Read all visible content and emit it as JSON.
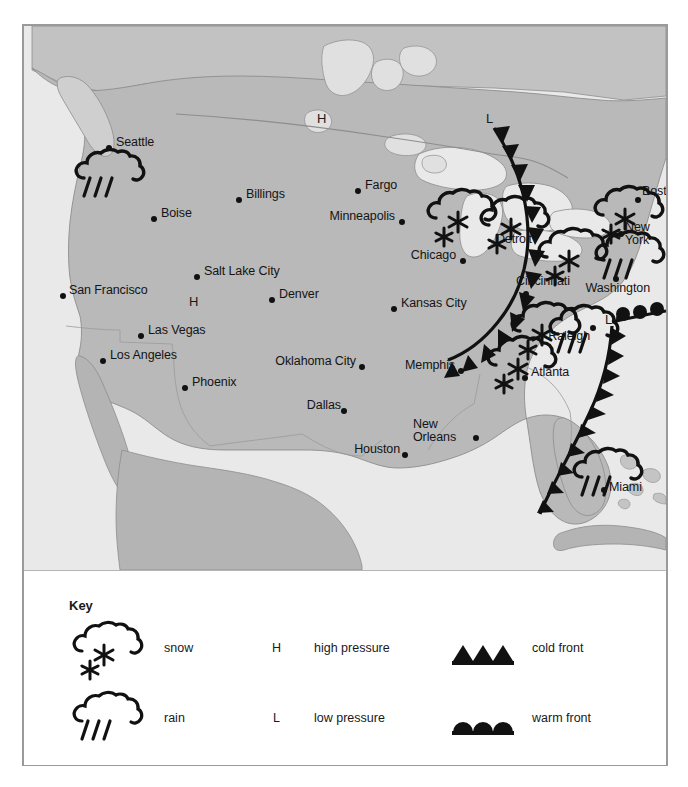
{
  "document": {
    "type": "weather-map",
    "region": "United States",
    "colors": {
      "land": "#b9b9b9",
      "water": "#e6e6e6",
      "canada_land": "#c6c6c6",
      "ink": "#111111",
      "frame": "#9a9a9a",
      "page": "#ffffff"
    }
  },
  "map": {
    "cities": [
      {
        "name": "Seattle",
        "label_x": 92,
        "label_y": 116,
        "dot_x": 85,
        "dot_y": 122,
        "align": "left"
      },
      {
        "name": "Billings",
        "label_x": 222,
        "label_y": 168,
        "dot_x": 215,
        "dot_y": 174,
        "align": "left"
      },
      {
        "name": "Boise",
        "label_x": 137,
        "label_y": 187,
        "dot_x": 130,
        "dot_y": 193,
        "align": "left"
      },
      {
        "name": "Fargo",
        "label_x": 341,
        "label_y": 159,
        "dot_x": 334,
        "dot_y": 165,
        "align": "left"
      },
      {
        "name": "Minneapolis",
        "label_x": 371,
        "label_y": 190,
        "dot_x": 378,
        "dot_y": 196,
        "align": "right"
      },
      {
        "name": "Chicago",
        "label_x": 432,
        "label_y": 229,
        "dot_x": 439,
        "dot_y": 235,
        "align": "right"
      },
      {
        "name": "Detroit",
        "label_x": 473,
        "label_y": 213,
        "dot_x": 512,
        "dot_y": 209,
        "align": "left"
      },
      {
        "name": "Salt Lake City",
        "label_x": 180,
        "label_y": 245,
        "dot_x": 173,
        "dot_y": 251,
        "align": "left"
      },
      {
        "name": "Denver",
        "label_x": 255,
        "label_y": 268,
        "dot_x": 248,
        "dot_y": 274,
        "align": "left"
      },
      {
        "name": "San Francisco",
        "label_x": 46,
        "label_y": 264,
        "dot_x": 39,
        "dot_y": 270,
        "align": "left"
      },
      {
        "name": "Kansas City",
        "label_x": 377,
        "label_y": 277,
        "dot_x": 370,
        "dot_y": 283,
        "align": "left"
      },
      {
        "name": "Cincinnati",
        "label_x": 495,
        "label_y": 255,
        "dot_x": 502,
        "dot_y": 268,
        "align": "left"
      },
      {
        "name": "Las Vegas",
        "label_x": 124,
        "label_y": 304,
        "dot_x": 117,
        "dot_y": 310,
        "align": "left"
      },
      {
        "name": "Los Angeles",
        "label_x": 86,
        "label_y": 329,
        "dot_x": 79,
        "dot_y": 335,
        "align": "left"
      },
      {
        "name": "Oklahoma City",
        "label_x": 246,
        "label_y": 335,
        "dot_x": 338,
        "dot_y": 341,
        "align": "left"
      },
      {
        "name": "Memphis",
        "label_x": 371,
        "label_y": 339,
        "dot_x": 437,
        "dot_y": 345,
        "align": "left"
      },
      {
        "name": "Atlanta",
        "label_x": 508,
        "label_y": 346,
        "dot_x": 501,
        "dot_y": 352,
        "align": "left"
      },
      {
        "name": "Raleigh",
        "label_x": 529,
        "label_y": 310,
        "dot_x": 569,
        "dot_y": 302,
        "align": "left"
      },
      {
        "name": "Washington",
        "label_x": 570,
        "label_y": 262,
        "dot_x": 592,
        "dot_y": 253,
        "align": "left"
      },
      {
        "name": "New\nYork",
        "label_x": 604,
        "label_y": 202,
        "dot_x": 597,
        "dot_y": 208,
        "align": "left"
      },
      {
        "name": "Boston",
        "label_x": 621,
        "label_y": 165,
        "dot_x": 614,
        "dot_y": 174,
        "align": "left"
      },
      {
        "name": "Phoenix",
        "label_x": 168,
        "label_y": 356,
        "dot_x": 161,
        "dot_y": 362,
        "align": "left"
      },
      {
        "name": "Dallas",
        "label_x": 281,
        "label_y": 379,
        "dot_x": 320,
        "dot_y": 385,
        "align": "left"
      },
      {
        "name": "New\nOrleans",
        "label_x": 394,
        "label_y": 399,
        "dot_x": 452,
        "dot_y": 412,
        "align": "left"
      },
      {
        "name": "Houston",
        "label_x": 321,
        "label_y": 423,
        "dot_x": 381,
        "dot_y": 429,
        "align": "left"
      },
      {
        "name": "Miami",
        "label_x": 587,
        "label_y": 458,
        "dot_x": 580,
        "dot_y": 464,
        "align": "left"
      }
    ],
    "pressure_systems": [
      {
        "type": "high",
        "symbol": "H",
        "x": 295,
        "y": 86
      },
      {
        "type": "high",
        "symbol": "H",
        "x": 167,
        "y": 270
      },
      {
        "type": "low",
        "symbol": "L",
        "x": 464,
        "y": 92
      },
      {
        "type": "low",
        "symbol": "L",
        "x": 583,
        "y": 293
      }
    ],
    "weather_symbols": [
      {
        "type": "snow",
        "x": 404,
        "y": 166,
        "city_ref": "Minneapolis-east"
      },
      {
        "type": "snow",
        "x": 457,
        "y": 173,
        "city_ref": "Detroit"
      },
      {
        "type": "snow",
        "x": 515,
        "y": 205,
        "city_ref": "Cincinnati-north"
      },
      {
        "type": "snow",
        "x": 571,
        "y": 163,
        "city_ref": "New York"
      },
      {
        "type": "rain",
        "x": 572,
        "y": 206,
        "city_ref": "Washington"
      },
      {
        "type": "snow",
        "x": 488,
        "y": 277,
        "city_ref": "Atlanta-north"
      },
      {
        "type": "snow",
        "x": 464,
        "y": 311,
        "city_ref": "Atlanta"
      },
      {
        "type": "rain",
        "x": 529,
        "y": 280,
        "city_ref": "Raleigh"
      },
      {
        "type": "rain",
        "x": 55,
        "y": 124,
        "city_ref": "Seattle"
      },
      {
        "type": "rain",
        "x": 552,
        "y": 424,
        "city_ref": "Miami"
      }
    ],
    "fronts": [
      {
        "type": "cold",
        "name": "main-cold-front",
        "description": "curving cold front from low near Great Lakes southwest to Memphis"
      },
      {
        "type": "warm",
        "name": "atlantic-warm-front",
        "description": "warm front extending east from low near Raleigh"
      },
      {
        "type": "cold",
        "name": "florida-cold-front",
        "description": "cold front trailing south along Florida coast"
      }
    ]
  },
  "key": {
    "title": "Key",
    "items": [
      {
        "symbol": "snow-cloud-icon",
        "label": "snow"
      },
      {
        "symbol": "rain-cloud-icon",
        "label": "rain"
      },
      {
        "symbol": "H",
        "label": "high pressure"
      },
      {
        "symbol": "L",
        "label": "low pressure"
      },
      {
        "symbol": "cold-front-icon",
        "label": "cold front"
      },
      {
        "symbol": "warm-front-icon",
        "label": "warm front"
      }
    ]
  }
}
